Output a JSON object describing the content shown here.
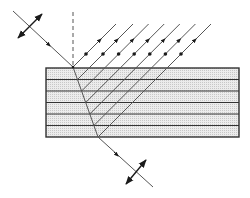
{
  "diagram": {
    "title": "Reflection and refraction of polarized light in a multilayer stack",
    "colors": {
      "line": "#555555",
      "dark": "#1a1a1a",
      "layer_fill": "#e6e6e6",
      "layer_border": "#333333",
      "background": "#ffffff"
    },
    "stack": {
      "x": 46,
      "y": 68,
      "width": 193,
      "height": 69,
      "layer_count": 6,
      "interfaces_y": [
        79.5,
        91,
        102.5,
        114,
        125.5
      ]
    },
    "normal_line": {
      "x": 73,
      "y1": 12,
      "y2": 67,
      "style": "dashed"
    },
    "incident_ray": {
      "from": [
        13,
        11
      ],
      "to": [
        73,
        67
      ],
      "arrow_at": [
        49,
        45
      ],
      "polarization": {
        "from": [
          18,
          38
        ],
        "to": [
          42,
          14
        ],
        "label": "double-arrow in plane"
      }
    },
    "refracted_ray": {
      "from": [
        73,
        67
      ],
      "to": [
        98,
        137
      ]
    },
    "transmitted_ray": {
      "from": [
        98,
        137
      ],
      "to": [
        153,
        187
      ],
      "arrow_at": [
        117,
        155
      ],
      "polarization": {
        "from": [
          126,
          184
        ],
        "to": [
          146,
          160
        ],
        "label": "double-arrow in plane"
      }
    },
    "reflected_rays": [
      {
        "from": [
          73,
          67
        ],
        "to": [
          116,
          24
        ]
      },
      {
        "from": [
          77.5,
          79.5
        ],
        "to": [
          133,
          24
        ]
      },
      {
        "from": [
          81.6,
          91
        ],
        "to": [
          148.6,
          24
        ]
      },
      {
        "from": [
          85.7,
          102.5
        ],
        "to": [
          164.2,
          24
        ]
      },
      {
        "from": [
          89.8,
          114
        ],
        "to": [
          179.8,
          24
        ]
      },
      {
        "from": [
          93.9,
          125.5
        ],
        "to": [
          195.4,
          24
        ]
      },
      {
        "from": [
          98,
          137
        ],
        "to": [
          211,
          24
        ]
      }
    ],
    "reflected_markers": {
      "dot_y": 54,
      "arrow_y": 40,
      "description": "dot = polarization perpendicular to plane, arrowhead = propagation direction"
    }
  }
}
